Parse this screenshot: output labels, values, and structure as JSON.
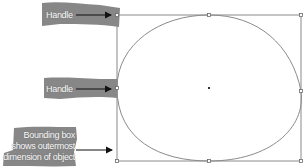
{
  "diagram": {
    "labels": {
      "handle_top": "Handle",
      "handle_middle": "Handle",
      "bounding_box_line1": "Bounding box",
      "bounding_box_line2": "shows outermost",
      "bounding_box_line3": "dimension of object"
    },
    "colors": {
      "label_band": "#7a7a7a",
      "box_line": "#8a8a8a",
      "shape_stroke": "#8a8a8a",
      "arrow": "#111111",
      "background": "#ffffff"
    },
    "bounding_box": {
      "left": 117,
      "top": 15,
      "right": 301,
      "bottom": 161
    },
    "handles": [
      {
        "name": "top-left",
        "x": 117,
        "y": 15
      },
      {
        "name": "top-middle",
        "x": 209,
        "y": 15
      },
      {
        "name": "top-right",
        "x": 301,
        "y": 15
      },
      {
        "name": "middle-left",
        "x": 117,
        "y": 88
      },
      {
        "name": "middle-right",
        "x": 301,
        "y": 91
      },
      {
        "name": "bottom-left",
        "x": 117,
        "y": 161
      },
      {
        "name": "bottom-middle",
        "x": 209,
        "y": 161
      },
      {
        "name": "bottom-right",
        "x": 301,
        "y": 161
      }
    ],
    "center_point": {
      "x": 209,
      "y": 88
    }
  }
}
